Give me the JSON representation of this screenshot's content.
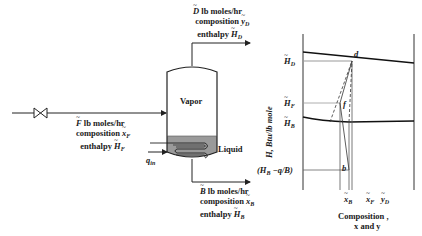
{
  "process": {
    "distillate": {
      "line1_sym": "D",
      "line1_text": " lb moles/hr",
      "line2_text": "composition ",
      "line2_sym": "y",
      "line2_sub": "D",
      "line3_text": "enthalpy ",
      "line3_sym": "H",
      "line3_sub": "D"
    },
    "feed": {
      "line1_sym": "F",
      "line1_text": " lb moles/hr",
      "line2_text": "composition ",
      "line2_sym": "x",
      "line2_sub": "F",
      "line3_text": "enthalpy ",
      "line3_sym": "H",
      "line3_sub": "F"
    },
    "bottoms": {
      "line1_sym": "B",
      "line1_text": " lb moles/hr",
      "line2_text": "composition ",
      "line2_sym": "x",
      "line2_sub": "B",
      "line3_text": "enthalpy ",
      "line3_sym": "H",
      "line3_sub": "B"
    },
    "vessel": {
      "vapor_label": "Vapor",
      "liquid_label": "Liquid"
    },
    "heat_input": {
      "sym": "q",
      "sub": "in"
    },
    "colors": {
      "liquid": "#9a9a9a",
      "line": "#222222"
    }
  },
  "enthalpy_chart": {
    "ylabel": "H, Btu/lb mole",
    "xlabel_line1": "Composition ,",
    "xlabel_line2": "x and y",
    "y_ticks": [
      {
        "sym": "H",
        "sub": "D"
      },
      {
        "sym": "H",
        "sub": "F"
      },
      {
        "sym": "H",
        "sub": "B"
      },
      {
        "text": "(H",
        "sub": "B",
        "rest": " −q/B)"
      }
    ],
    "x_ticks": [
      {
        "sym": "x",
        "sub": "B"
      },
      {
        "sym": "x",
        "sub": "F"
      },
      {
        "sym": "y",
        "sub": "D"
      }
    ],
    "points": {
      "d": "d",
      "f": "f",
      "b": "b"
    }
  }
}
